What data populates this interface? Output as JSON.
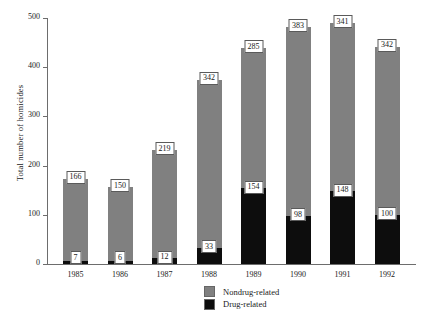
{
  "chart_data": {
    "type": "bar",
    "subtype": "stacked",
    "title": "",
    "xlabel": "",
    "ylabel": "Total number of homicides",
    "categories": [
      "1985",
      "1986",
      "1987",
      "1988",
      "1989",
      "1990",
      "1991",
      "1992"
    ],
    "series": [
      {
        "name": "Nondrug-related",
        "color": "#808080",
        "values": [
          166,
          150,
          219,
          342,
          285,
          383,
          341,
          342
        ]
      },
      {
        "name": "Drug-related",
        "color": "#0d0d0d",
        "values": [
          7,
          6,
          12,
          33,
          154,
          98,
          148,
          100
        ]
      }
    ],
    "totals": [
      173,
      156,
      231,
      375,
      439,
      481,
      489,
      442
    ],
    "ylim": [
      0,
      500
    ],
    "yticks": [
      0,
      100,
      200,
      300,
      400,
      500
    ],
    "ytick_labels": [
      "0",
      "100",
      "200",
      "300",
      "400",
      "500"
    ],
    "grid": false,
    "legend_position": "bottom-center",
    "data_labels": true,
    "note": "Each bar segment is annotated with its own value in a boxed white label; the nondrug label sits atop the bar, the drug label sits at the top of the black segment."
  },
  "legend": {
    "items": [
      {
        "label": "Nondrug-related",
        "color": "#808080"
      },
      {
        "label": "Drug-related",
        "color": "#0d0d0d"
      }
    ]
  }
}
